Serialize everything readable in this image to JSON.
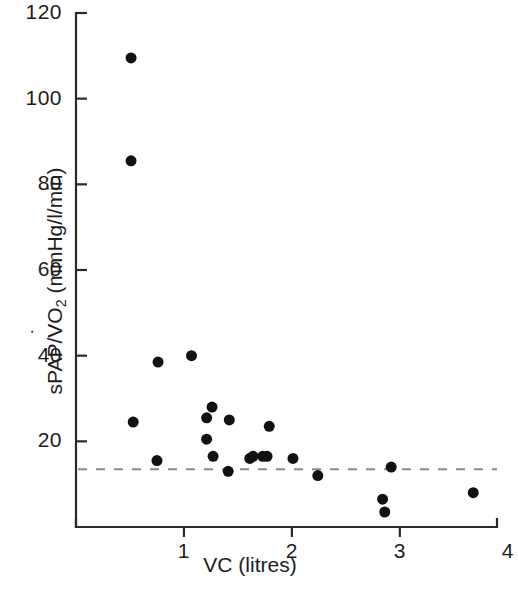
{
  "chart_data": {
    "type": "scatter",
    "title": "",
    "xlabel": "VC (litres)",
    "ylabel": "sPAP/VO2 (mmHg/l/min)",
    "ylabel_parts": {
      "prefix": "sPAP/",
      "v_dotted": "V",
      "o": "O",
      "o_subscript": "2",
      "units": " (mmHg/l/min)"
    },
    "xlim": [
      0,
      3.9
    ],
    "ylim": [
      0,
      120
    ],
    "xticks": [
      1,
      2,
      3,
      4
    ],
    "xtick_labels": [
      "1",
      "2",
      "3",
      "4"
    ],
    "yticks": [
      20,
      40,
      60,
      80,
      100,
      120
    ],
    "ytick_labels": [
      "20",
      "40",
      "60",
      "80",
      "100",
      "120"
    ],
    "grid": false,
    "legend": null,
    "marker": {
      "shape": "circle",
      "color": "#111111",
      "size_px": 11
    },
    "reference_line": {
      "type": "horizontal-dashed",
      "y": 13.5,
      "color": "#8a8a8a",
      "dash": "9 9"
    },
    "axis_color": "#2a2a2a",
    "points": [
      {
        "x": 0.51,
        "y": 109.5
      },
      {
        "x": 0.51,
        "y": 85.5
      },
      {
        "x": 0.53,
        "y": 24.5
      },
      {
        "x": 0.76,
        "y": 38.5
      },
      {
        "x": 0.75,
        "y": 15.5
      },
      {
        "x": 1.07,
        "y": 40.0
      },
      {
        "x": 1.21,
        "y": 25.5
      },
      {
        "x": 1.26,
        "y": 28.0
      },
      {
        "x": 1.21,
        "y": 20.5
      },
      {
        "x": 1.27,
        "y": 16.5
      },
      {
        "x": 1.42,
        "y": 25.0
      },
      {
        "x": 1.41,
        "y": 13.0
      },
      {
        "x": 1.61,
        "y": 16.0
      },
      {
        "x": 1.64,
        "y": 16.5
      },
      {
        "x": 1.73,
        "y": 16.5
      },
      {
        "x": 1.77,
        "y": 16.5
      },
      {
        "x": 1.79,
        "y": 23.5
      },
      {
        "x": 2.01,
        "y": 16.0
      },
      {
        "x": 2.24,
        "y": 12.0
      },
      {
        "x": 2.84,
        "y": 6.5
      },
      {
        "x": 2.86,
        "y": 3.5
      },
      {
        "x": 2.92,
        "y": 14.0
      },
      {
        "x": 3.68,
        "y": 8.0
      }
    ]
  }
}
